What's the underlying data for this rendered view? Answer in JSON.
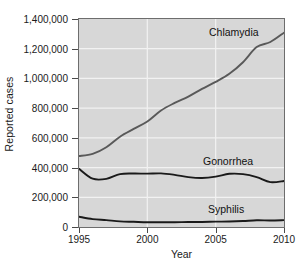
{
  "chart_data": {
    "type": "line",
    "title": "",
    "xlabel": "Year",
    "ylabel": "Reported cases",
    "xlim": [
      1995,
      2010
    ],
    "ylim": [
      0,
      1400000
    ],
    "grid": true,
    "legend_position": "inline-annotations",
    "x_ticks": [
      1995,
      2000,
      2005,
      2010
    ],
    "x_tick_labels": [
      "1995",
      "2000",
      "2005",
      "2010"
    ],
    "y_ticks": [
      0,
      200000,
      400000,
      600000,
      800000,
      1000000,
      1200000,
      1400000
    ],
    "y_tick_labels": [
      "0",
      "200,000",
      "400,000",
      "600,000",
      "800,000",
      "1,000,000",
      "1,200,000",
      "1,400,000"
    ],
    "x": [
      1995,
      1996,
      1997,
      1998,
      1999,
      2000,
      2001,
      2002,
      2003,
      2004,
      2005,
      2006,
      2007,
      2008,
      2009,
      2010
    ],
    "series": [
      {
        "name": "Chlamydia",
        "color": "#595959",
        "values": [
          478000,
          492000,
          537000,
          608000,
          660000,
          710000,
          784000,
          835000,
          878000,
          930000,
          977000,
          1031000,
          1109000,
          1211000,
          1245000,
          1308000
        ]
      },
      {
        "name": "Gonorrhea",
        "color": "#1a1a1a",
        "values": [
          392000,
          325000,
          324000,
          356000,
          360000,
          359000,
          361000,
          351000,
          336000,
          330000,
          339000,
          358000,
          356000,
          336000,
          302000,
          310000
        ]
      },
      {
        "name": "Syphilis",
        "color": "#1a1a1a",
        "values": [
          69000,
          53000,
          46000,
          38000,
          35000,
          32000,
          32000,
          32000,
          34000,
          34000,
          36000,
          37000,
          40000,
          45000,
          44000,
          46000
        ]
      }
    ],
    "annotations": [
      {
        "text": "Chlamydia",
        "x_px": 209,
        "y_px": 26
      },
      {
        "text": "Gonorrhea",
        "x_px": 203,
        "y_px": 155
      },
      {
        "text": "Syphilis",
        "x_px": 208,
        "y_px": 203
      }
    ]
  }
}
